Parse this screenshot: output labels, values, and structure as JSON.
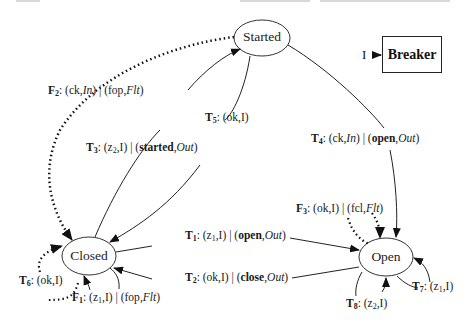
{
  "diagram": {
    "type": "state-machine",
    "component": {
      "name": "Breaker",
      "input_label": "I"
    },
    "states": [
      {
        "id": "started",
        "label": "Started"
      },
      {
        "id": "closed",
        "label": "Closed"
      },
      {
        "id": "open",
        "label": "Open"
      }
    ],
    "transitions": [
      {
        "id": "F2",
        "name": "F",
        "sub": "2",
        "from": "started",
        "to": "closed",
        "style": "dotted",
        "input": "ck",
        "input_port": "In",
        "output": "fop",
        "output_port": "Flt"
      },
      {
        "id": "T3",
        "name": "T",
        "sub": "3",
        "from": "closed",
        "to": "started",
        "style": "solid",
        "input": "z2",
        "input_port": "I",
        "output": "started",
        "output_port": "Out"
      },
      {
        "id": "T5",
        "name": "T",
        "sub": "5",
        "from": "started",
        "to": "closed",
        "style": "solid",
        "input": "ok",
        "input_port": "I"
      },
      {
        "id": "T4",
        "name": "T",
        "sub": "4",
        "from": "started",
        "to": "open",
        "style": "solid",
        "input": "ck",
        "input_port": "In",
        "output": "open",
        "output_port": "Out"
      },
      {
        "id": "F3",
        "name": "F",
        "sub": "3",
        "from": "open",
        "to": "open",
        "style": "dotted",
        "input": "ok",
        "input_port": "I",
        "output": "fcl",
        "output_port": "Flt"
      },
      {
        "id": "T1",
        "name": "T",
        "sub": "1",
        "from": "closed",
        "to": "open",
        "style": "solid",
        "input": "z1",
        "input_port": "I",
        "output": "open",
        "output_port": "Out"
      },
      {
        "id": "T2",
        "name": "T",
        "sub": "2",
        "from": "open",
        "to": "closed",
        "style": "solid",
        "input": "ok",
        "input_port": "I",
        "output": "close",
        "output_port": "Out"
      },
      {
        "id": "T6",
        "name": "T",
        "sub": "6",
        "from": "closed",
        "to": "closed",
        "style": "dotted",
        "input": "ok",
        "input_port": "I"
      },
      {
        "id": "F1",
        "name": "F",
        "sub": "1",
        "from": "closed",
        "to": "closed",
        "style": "solid",
        "input": "z1",
        "input_port": "I",
        "output": "fop",
        "output_port": "Flt"
      },
      {
        "id": "T7",
        "name": "T",
        "sub": "7",
        "from": "open",
        "to": "open",
        "style": "solid",
        "input": "z1",
        "input_port": "I"
      },
      {
        "id": "T8",
        "name": "T",
        "sub": "8",
        "from": "open",
        "to": "open",
        "style": "solid",
        "input": "z2",
        "input_port": "I"
      }
    ],
    "labels": {
      "F2": {
        "name": "F",
        "sub": "2",
        "in": "ck",
        "in_port": "In",
        "out": "fop",
        "out_port": "Flt"
      },
      "T3": {
        "name": "T",
        "sub": "3",
        "in": "z",
        "in_sub": "2",
        "in_port": "I",
        "out": "started",
        "out_port": "Out"
      },
      "T5": {
        "name": "T",
        "sub": "5",
        "in": "ok",
        "in_port": "I"
      },
      "T4": {
        "name": "T",
        "sub": "4",
        "in": "ck",
        "in_port": "In",
        "out": "open",
        "out_port": "Out"
      },
      "F3": {
        "name": "F",
        "sub": "3",
        "in": "ok",
        "in_port": "I",
        "out": "fcl",
        "out_port": "Flt"
      },
      "T1": {
        "name": "T",
        "sub": "1",
        "in": "z",
        "in_sub": "1",
        "in_port": "I",
        "out": "open",
        "out_port": "Out"
      },
      "T2": {
        "name": "T",
        "sub": "2",
        "in": "ok",
        "in_port": "I",
        "out": "close",
        "out_port": "Out"
      },
      "T6": {
        "name": "T",
        "sub": "6",
        "in": "ok",
        "in_port": "I"
      },
      "F1": {
        "name": "F",
        "sub": "1",
        "in": "z",
        "in_sub": "1",
        "in_port": "I",
        "out": "fop",
        "out_port": "Flt"
      },
      "T7": {
        "name": "T",
        "sub": "7",
        "in": "z",
        "in_sub": "1",
        "in_port": "I"
      },
      "T8": {
        "name": "T",
        "sub": "8",
        "in": "z",
        "in_sub": "2",
        "in_port": "I"
      }
    },
    "punct": {
      "colon": ": ",
      "open": "(",
      "comma": ",",
      "close": ")",
      "bar": " | "
    }
  }
}
